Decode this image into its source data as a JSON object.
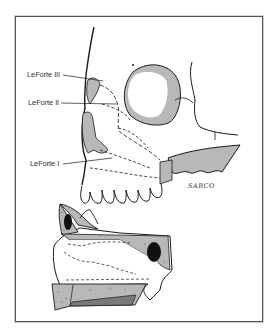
{
  "figure": {
    "labels": [
      {
        "id": "lefort-iii",
        "text": "LeForte III"
      },
      {
        "id": "lefort-ii",
        "text": "LeForte II"
      },
      {
        "id": "lefort-i",
        "text": "LeForte I"
      }
    ],
    "signature": "SABCO",
    "colors": {
      "line": "#1a1a1a",
      "bone_shade": "#b8b8b8",
      "dark_shade": "#7a7a7a",
      "sinus": "#111111",
      "frame": "#555555"
    }
  }
}
